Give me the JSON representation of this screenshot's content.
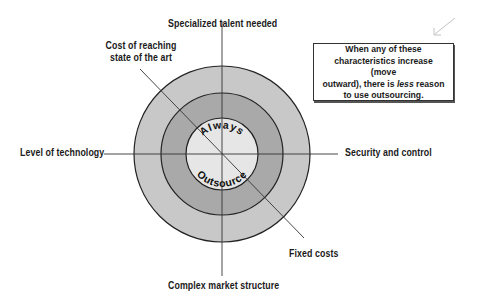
{
  "diagram": {
    "center_labels": {
      "top": "Always",
      "bottom": "Outsource"
    },
    "axes": [
      {
        "id": "top",
        "label": "Specialized talent needed"
      },
      {
        "id": "upper-left",
        "label_line1": "Cost of reaching",
        "label_line2": "state of the art"
      },
      {
        "id": "left",
        "label": "Level of technology"
      },
      {
        "id": "right",
        "label": "Security and control"
      },
      {
        "id": "lower-right",
        "label": "Fixed costs"
      },
      {
        "id": "bottom",
        "label": "Complex market structure"
      }
    ],
    "rings": [
      {
        "name": "outer",
        "color": "#c8c8c8"
      },
      {
        "name": "middle",
        "color": "#a8a8a8"
      },
      {
        "name": "inner",
        "color": "#e6e6e6"
      }
    ],
    "note": {
      "line1": "When any of these",
      "line2": "characteristics increase (move",
      "line3_pre": "outward), there is ",
      "line3_em": "less",
      "line3_post": " reason",
      "line4": "to use outsourcing."
    }
  }
}
